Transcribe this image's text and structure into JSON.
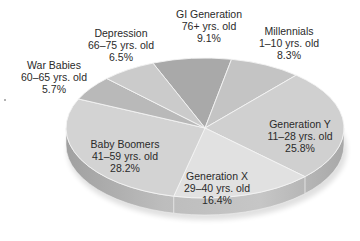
{
  "chart_data": {
    "type": "pie",
    "style": "3d-tilted",
    "title": "",
    "slices": [
      {
        "name": "GI Generation",
        "ages": "76+ yrs. old",
        "percent": 9.1,
        "pct_label": "9.1%",
        "color": "#a9a9a9",
        "start": 248,
        "end": 281
      },
      {
        "name": "Millennials",
        "ages": "1–10 yrs. old",
        "percent": 8.3,
        "pct_label": "8.3%",
        "color": "#c4c4c4",
        "start": 281,
        "end": 311
      },
      {
        "name": "Generation Y",
        "ages": "11–28 yrs. old",
        "percent": 25.8,
        "pct_label": "25.8%",
        "color": "#d0d0d0",
        "start": 311,
        "end": 404
      },
      {
        "name": "Generation X",
        "ages": "29–40 yrs. old",
        "percent": 16.4,
        "pct_label": "16.4%",
        "color": "#e1e1e1",
        "start": 404,
        "end": 463
      },
      {
        "name": "Baby Boomers",
        "ages": "41–59 yrs. old",
        "percent": 28.2,
        "pct_label": "28.2%",
        "color": "#d3d3d3",
        "start": 463,
        "end": 564.5
      },
      {
        "name": "War Babies",
        "ages": "60–65 yrs. old",
        "percent": 5.7,
        "pct_label": "5.7%",
        "color": "#b9b9b9",
        "start": 564.5,
        "end": 585
      },
      {
        "name": "Depression",
        "ages": "66–75 yrs. old",
        "percent": 6.5,
        "pct_label": "6.5%",
        "color": "#cbcbcb",
        "start": 585,
        "end": 608
      }
    ],
    "legend": "none (labels placed on/near slices)"
  },
  "labels": {
    "gi": {
      "name": "GI Generation",
      "ages": "76+ yrs. old",
      "pct": "9.1%"
    },
    "millennials": {
      "name": "Millennials",
      "ages": "1–10 yrs. old",
      "pct": "8.3%"
    },
    "geny": {
      "name": "Generation Y",
      "ages": "11–28 yrs. old",
      "pct": "25.8%"
    },
    "genx": {
      "name": "Generation X",
      "ages": "29–40 yrs. old",
      "pct": "16.4%"
    },
    "boomers": {
      "name": "Baby Boomers",
      "ages": "41–59 yrs. old",
      "pct": "28.2%"
    },
    "warbabies": {
      "name": "War Babies",
      "ages": "60–65 yrs. old",
      "pct": "5.7%"
    },
    "depression": {
      "name": "Depression",
      "ages": "66–75 yrs. old",
      "pct": "6.5%"
    }
  }
}
